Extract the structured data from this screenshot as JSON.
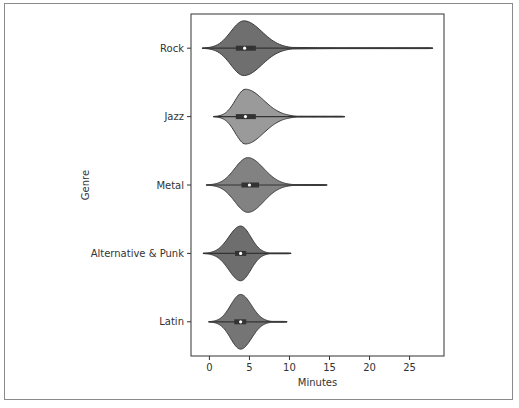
{
  "chart_data": {
    "type": "violin",
    "orientation": "horizontal",
    "title": "",
    "xlabel": "Minutes",
    "ylabel": "Genre",
    "xlim": [
      -2.3,
      29.3
    ],
    "xticks": [
      0,
      5,
      10,
      15,
      20,
      25
    ],
    "grid": false,
    "categories": [
      "Rock",
      "Jazz",
      "Metal",
      "Alternative & Punk",
      "Latin"
    ],
    "series": [
      {
        "name": "Rock",
        "min": -0.9,
        "max": 27.9,
        "q1": 3.3,
        "median": 4.4,
        "q3": 5.8,
        "mode": 4.3,
        "color": "#6f6f6f"
      },
      {
        "name": "Jazz",
        "min": 0.5,
        "max": 16.9,
        "q1": 3.3,
        "median": 4.5,
        "q3": 5.8,
        "mode": 4.5,
        "color": "#9a9a9a"
      },
      {
        "name": "Metal",
        "min": -0.4,
        "max": 14.7,
        "q1": 4.0,
        "median": 5.0,
        "q3": 6.2,
        "mode": 4.8,
        "color": "#828282"
      },
      {
        "name": "Alternative & Punk",
        "min": -0.8,
        "max": 10.2,
        "q1": 3.2,
        "median": 3.9,
        "q3": 4.6,
        "mode": 3.9,
        "color": "#6e6e6e"
      },
      {
        "name": "Latin",
        "min": -0.1,
        "max": 9.7,
        "q1": 3.1,
        "median": 3.9,
        "q3": 4.6,
        "mode": 3.9,
        "color": "#757575"
      }
    ]
  }
}
